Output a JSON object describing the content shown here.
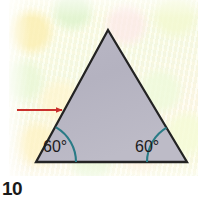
{
  "figure": {
    "page_number": "10",
    "shape": {
      "name": "triangle",
      "vertices": [
        {
          "label": "apex",
          "x": 108,
          "y": 30
        },
        {
          "label": "bottom-right",
          "x": 187,
          "y": 162
        },
        {
          "label": "bottom-left",
          "x": 36,
          "y": 162
        }
      ],
      "fill_color": "#b6b4c2",
      "stroke_color": "#232323",
      "stroke_width": 2.2
    },
    "angle_marks": [
      {
        "name": "left-angle",
        "label": "60°",
        "value": 60,
        "unit": "degrees",
        "arc_color": "#2a7b86",
        "vertex": {
          "x": 36,
          "y": 162
        },
        "label_position": {
          "x": 51,
          "y": 152
        }
      },
      {
        "name": "right-angle",
        "label": "60°",
        "value": 60,
        "unit": "degrees",
        "arc_color": "#2a7b86",
        "vertex": {
          "x": 187,
          "y": 162
        },
        "label_position": {
          "x": 142,
          "y": 152
        }
      }
    ],
    "pointer": {
      "name": "red-arrow",
      "color": "#c9302c",
      "direction": "right",
      "from": {
        "x": 17,
        "y": 110
      },
      "to": {
        "x": 64,
        "y": 110
      },
      "points_at": "left-side-of-triangle"
    },
    "background": {
      "paper_color": "#f2f4de",
      "margin_color": "#ffffff"
    }
  }
}
